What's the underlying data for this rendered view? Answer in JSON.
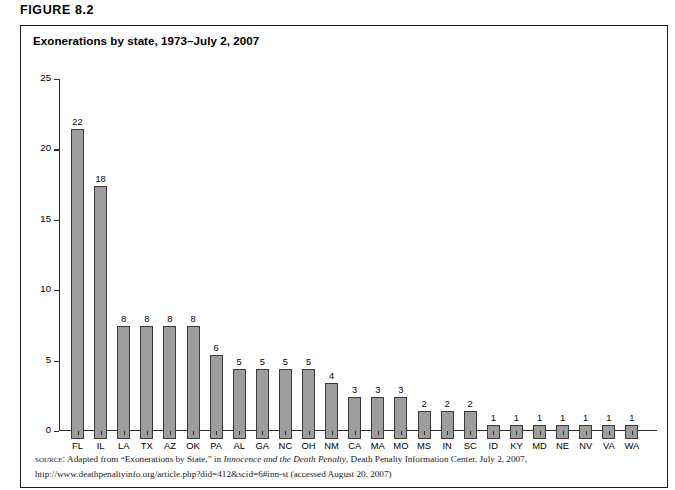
{
  "figure": {
    "number_label": "FIGURE 8.2",
    "title": "Exonerations by state, 1973–July 2, 2007"
  },
  "source": {
    "label": "source:",
    "text_before_italic": " Adapted from “Exonerations by State,” in ",
    "italic_title": "Innocence and the Death Penalty",
    "text_after_italic": ", Death Penalty Information Center, July 2, 2007, http://www.deathpenaltyinfo.org/article.php?did=412&scid=6#inn-st (accessed August 20, 2007)"
  },
  "chart_data": {
    "type": "bar",
    "title": "Exonerations by state, 1973–July 2, 2007",
    "xlabel": "",
    "ylabel": "",
    "ylim": [
      0,
      25
    ],
    "yticks": [
      0,
      5,
      10,
      15,
      20,
      25
    ],
    "ytick_labels": [
      "0",
      "5",
      "10",
      "15",
      "20",
      "25"
    ],
    "grid": false,
    "legend": false,
    "bar_color": "#9d9d9d",
    "bar_edge_color": "#3a3a3a",
    "show_value_labels": true,
    "categories": [
      "FL",
      "IL",
      "LA",
      "TX",
      "AZ",
      "OK",
      "PA",
      "AL",
      "GA",
      "NC",
      "OH",
      "NM",
      "CA",
      "MA",
      "MO",
      "MS",
      "IN",
      "SC",
      "ID",
      "KY",
      "MD",
      "NE",
      "NV",
      "VA",
      "WA"
    ],
    "values": [
      22,
      18,
      8,
      8,
      8,
      8,
      6,
      5,
      5,
      5,
      5,
      4,
      3,
      3,
      3,
      2,
      2,
      2,
      1,
      1,
      1,
      1,
      1,
      1,
      1
    ],
    "value_labels": [
      "22",
      "18",
      "8",
      "8",
      "8",
      "8",
      "6",
      "5",
      "5",
      "5",
      "5",
      "4",
      "3",
      "3",
      "3",
      "2",
      "2",
      "2",
      "1",
      "1",
      "1",
      "1",
      "1",
      "1",
      "1"
    ]
  }
}
